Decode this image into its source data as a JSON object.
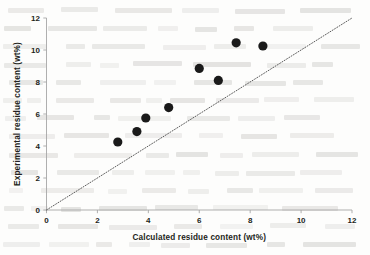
{
  "figure": {
    "background_color": "#fdfdfc",
    "marker_color": "#1a1a1a",
    "axis_color": "#a6a6a6",
    "parity_line_color": "#4a4a4a"
  },
  "axes": {
    "x_title": "Calculated residue content (wt%)",
    "y_title": "Experimental residue content (wt%)",
    "x_ticks": [
      "0",
      "2",
      "4",
      "6",
      "8",
      "10",
      "12"
    ],
    "y_ticks": [
      "0",
      "2",
      "4",
      "6",
      "8",
      "10",
      "12"
    ]
  },
  "chart_data": {
    "type": "scatter",
    "title": "",
    "xlabel": "Calculated residue content (wt%)",
    "ylabel": "Experimental residue content (wt%)",
    "xlim": [
      0,
      12
    ],
    "ylim": [
      0,
      12
    ],
    "xticks": [
      0,
      2,
      4,
      6,
      8,
      10,
      12
    ],
    "yticks": [
      0,
      2,
      4,
      6,
      8,
      10,
      12
    ],
    "grid": false,
    "legend": null,
    "series": [
      {
        "name": "Residue content samples",
        "marker": "filled-circle",
        "color": "#1a1a1a",
        "points": [
          {
            "x": 2.8,
            "y": 4.25
          },
          {
            "x": 3.55,
            "y": 4.9
          },
          {
            "x": 3.9,
            "y": 5.75
          },
          {
            "x": 4.8,
            "y": 6.4
          },
          {
            "x": 6.0,
            "y": 8.85
          },
          {
            "x": 6.75,
            "y": 8.1
          },
          {
            "x": 7.45,
            "y": 10.45
          },
          {
            "x": 8.5,
            "y": 10.25
          }
        ]
      }
    ],
    "reference_lines": [
      {
        "name": "parity-line",
        "style": "dotted",
        "from": {
          "x": 0,
          "y": 0
        },
        "to": {
          "x": 12,
          "y": 12
        }
      }
    ]
  }
}
